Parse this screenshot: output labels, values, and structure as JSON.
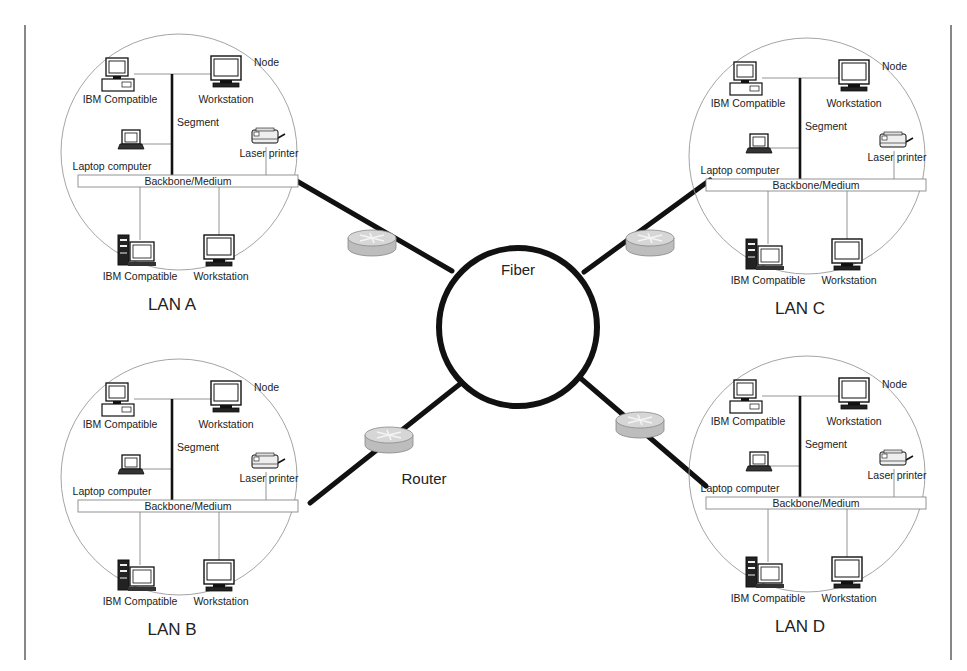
{
  "diagram": {
    "type": "network-topology",
    "colors": {
      "ink": "#111111",
      "thin_line": "#888888",
      "lan_circle": "#999999",
      "router_fill": "#c8c8c8",
      "backbone_fill": "#ffffff"
    },
    "center": {
      "label": "Fiber",
      "shape": "ring",
      "cx": 518,
      "cy": 327,
      "r": 80
    },
    "router_label": "Router",
    "lans": [
      {
        "id": "A",
        "name": "LAN A",
        "ox": 64,
        "oy": 30,
        "nodes": {
          "ibm_top": "IBM Compatible",
          "workstation_top": "Workstation",
          "node_label": "Node",
          "segment": "Segment",
          "laptop": "Laptop computer",
          "printer": "Laser printer",
          "backbone": "Backbone/Medium",
          "ibm_bottom": "IBM Compatible",
          "workstation_bottom": "Workstation"
        }
      },
      {
        "id": "B",
        "name": "LAN B",
        "ox": 64,
        "oy": 355,
        "nodes": {
          "ibm_top": "IBM Compatible",
          "workstation_top": "Workstation",
          "node_label": "Node",
          "segment": "Segment",
          "laptop": "Laptop computer",
          "printer": "Laser printer",
          "backbone": "Backbone/Medium",
          "ibm_bottom": "IBM Compatible",
          "workstation_bottom": "Workstation"
        }
      },
      {
        "id": "C",
        "name": "LAN C",
        "ox": 692,
        "oy": 34,
        "nodes": {
          "ibm_top": "IBM Compatible",
          "workstation_top": "Workstation",
          "node_label": "Node",
          "segment": "Segment",
          "laptop": "Laptop computer",
          "printer": "Laser printer",
          "backbone": "Backbone/Medium",
          "ibm_bottom": "IBM Compatible",
          "workstation_bottom": "Workstation"
        }
      },
      {
        "id": "D",
        "name": "LAN D",
        "ox": 692,
        "oy": 352,
        "nodes": {
          "ibm_top": "IBM Compatible",
          "workstation_top": "Workstation",
          "node_label": "Node",
          "segment": "Segment",
          "laptop": "Laptop computer",
          "printer": "Laser printer",
          "backbone": "Backbone/Medium",
          "ibm_bottom": "IBM Compatible",
          "workstation_bottom": "Workstation"
        }
      }
    ]
  }
}
